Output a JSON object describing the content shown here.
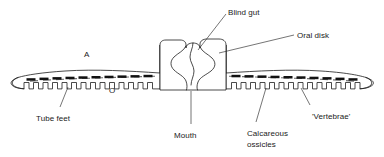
{
  "figure": {
    "type": "biological-anatomy-diagram",
    "background_color": "#ffffff",
    "line_color": "#1d1d1d",
    "text_color": "#1a1a1a",
    "ossicle_color": "#111111",
    "dash_color": "#6f6f6f"
  },
  "labels": [
    {
      "id": "blind-gut",
      "text": "Blind gut",
      "x": 228,
      "y": 8,
      "anchor": "start"
    },
    {
      "id": "oral-disk",
      "text": "Oral disk",
      "x": 297,
      "y": 31,
      "anchor": "start"
    },
    {
      "id": "tube-feet",
      "text": "Tube feet",
      "x": 36,
      "y": 114,
      "anchor": "start"
    },
    {
      "id": "mouth",
      "text": "Mouth",
      "x": 174,
      "y": 131,
      "anchor": "start"
    },
    {
      "id": "calcareous-ossicles",
      "text": "Calcareous",
      "x": 247,
      "y": 129,
      "anchor": "start"
    },
    {
      "id": "calcareous-ossicles-line2",
      "text": "ossicles",
      "x": 247,
      "y": 140,
      "anchor": "start"
    },
    {
      "id": "vertebrae",
      "text": "'Vertebrae'",
      "x": 312,
      "y": 112,
      "anchor": "start"
    }
  ],
  "axis_letters": [
    {
      "id": "aboral-marker",
      "text": "A",
      "x": 84,
      "y": 54
    },
    {
      "id": "oral-marker",
      "text": "O",
      "x": 109,
      "y": 89
    }
  ],
  "leader_lines": [
    {
      "id": "leader-blind-gut",
      "from": [
        226,
        14
      ],
      "to": [
        198,
        50
      ]
    },
    {
      "id": "leader-oral-disk",
      "from": [
        294,
        35
      ],
      "to": [
        219,
        53
      ]
    },
    {
      "id": "leader-tube-feet",
      "from": [
        60,
        107
      ],
      "to": [
        68,
        87
      ]
    },
    {
      "id": "leader-mouth",
      "from": [
        191,
        124
      ],
      "to": [
        191,
        90
      ]
    },
    {
      "id": "leader-ossicles",
      "from": [
        256,
        122
      ],
      "to": [
        266,
        88
      ]
    },
    {
      "id": "leader-vertebrae",
      "from": [
        310,
        105
      ],
      "to": [
        301,
        88
      ]
    }
  ],
  "anatomy": {
    "arm_count": 2,
    "left_arm_tube_feet": 17,
    "right_arm_tube_feet": 18,
    "left_arm_ossicles": 10,
    "right_arm_ossicles": 11
  }
}
